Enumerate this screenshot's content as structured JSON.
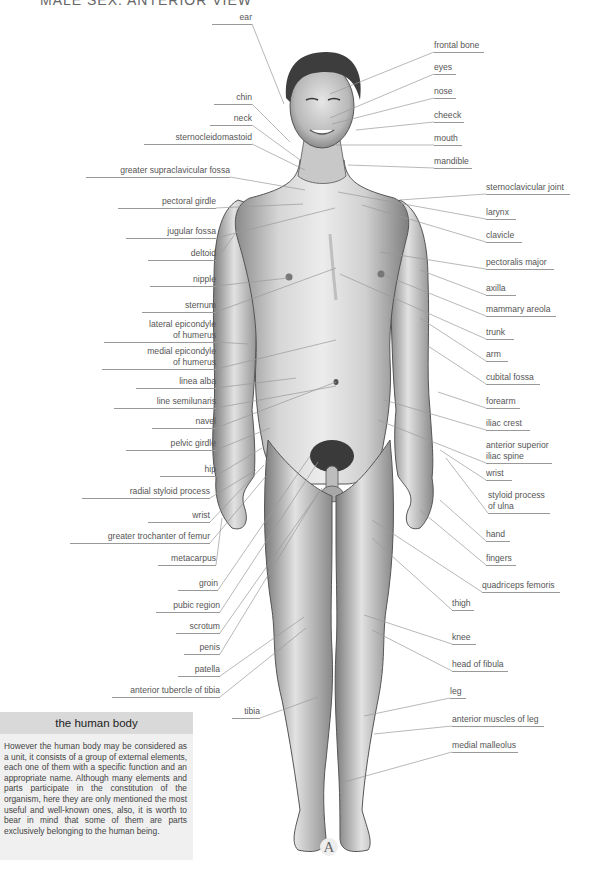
{
  "header": {
    "title": "MALE SEX: ANTERIOR VIEW"
  },
  "figure": {
    "plate_letter": "A"
  },
  "labels_left": [
    {
      "id": "ear",
      "text": "ear",
      "x": 212,
      "y": 12,
      "w": 40,
      "tx": 284,
      "ty": 104
    },
    {
      "id": "chin",
      "text": "chin",
      "x": 214,
      "y": 92,
      "w": 38,
      "tx": 290,
      "ty": 142
    },
    {
      "id": "neck",
      "text": "neck",
      "x": 210,
      "y": 113,
      "w": 42,
      "tx": 300,
      "ty": 160
    },
    {
      "id": "sternocleidomastoid",
      "text": "sternocleidomastoid",
      "x": 144,
      "y": 132,
      "w": 108,
      "tx": 305,
      "ty": 170
    },
    {
      "id": "greater-supraclavicular-fossa",
      "text": "greater supraclavicular fossa",
      "x": 86,
      "y": 165,
      "w": 144,
      "tx": 305,
      "ty": 190
    },
    {
      "id": "pectoral-girdle",
      "text": "pectoral girdle",
      "x": 118,
      "y": 196,
      "w": 98,
      "tx": 303,
      "ty": 204
    },
    {
      "id": "jugular-fossa",
      "text": "jugular fossa",
      "x": 126,
      "y": 226,
      "w": 90,
      "tx": 335,
      "ty": 208
    },
    {
      "id": "deltoid",
      "text": "deltoid",
      "x": 148,
      "y": 248,
      "w": 68,
      "tx": 238,
      "ty": 230
    },
    {
      "id": "nipple",
      "text": "nipple",
      "x": 150,
      "y": 274,
      "w": 66,
      "tx": 288,
      "ty": 278
    },
    {
      "id": "sternum",
      "text": "sternum",
      "x": 142,
      "y": 300,
      "w": 74,
      "tx": 336,
      "ty": 268
    },
    {
      "id": "lateral-epicondyle-of-humerus",
      "text": "lateral epicondyle\nof humerus",
      "x": 104,
      "y": 319,
      "w": 112,
      "tx": 248,
      "ty": 344
    },
    {
      "id": "medial-epicondyle-of-humerus",
      "text": "medial epicondyle\nof humerus",
      "x": 102,
      "y": 346,
      "w": 114,
      "tx": 336,
      "ty": 340
    },
    {
      "id": "linea-alba",
      "text": "linea alba",
      "x": 136,
      "y": 376,
      "w": 80,
      "tx": 296,
      "ty": 378
    },
    {
      "id": "line-semilunaris",
      "text": "line semilunaris",
      "x": 114,
      "y": 396,
      "w": 102,
      "tx": 336,
      "ty": 386
    },
    {
      "id": "navel",
      "text": "navel",
      "x": 152,
      "y": 416,
      "w": 64,
      "tx": 336,
      "ty": 382
    },
    {
      "id": "pelvic-girdle",
      "text": "pelvic girdle",
      "x": 126,
      "y": 438,
      "w": 90,
      "tx": 270,
      "ty": 428
    },
    {
      "id": "hip",
      "text": "hip",
      "x": 160,
      "y": 464,
      "w": 56,
      "tx": 262,
      "ty": 448
    },
    {
      "id": "radial-styloid-process",
      "text": "radial styloid process",
      "x": 82,
      "y": 486,
      "w": 128,
      "tx": 256,
      "ty": 470
    },
    {
      "id": "wrist-left",
      "text": "wrist",
      "x": 148,
      "y": 510,
      "w": 62,
      "tx": 264,
      "ty": 465
    },
    {
      "id": "greater-trochanter-of-femur",
      "text": "greater trochanter of femur",
      "x": 70,
      "y": 531,
      "w": 140,
      "tx": 266,
      "ty": 476
    },
    {
      "id": "metacarpus",
      "text": "metacarpus",
      "x": 158,
      "y": 553,
      "w": 58,
      "tx": 222,
      "ty": 518
    },
    {
      "id": "groin",
      "text": "groin",
      "x": 178,
      "y": 578,
      "w": 40,
      "tx": 310,
      "ty": 456
    },
    {
      "id": "pubic-region",
      "text": "pubic region",
      "x": 156,
      "y": 600,
      "w": 64,
      "tx": 318,
      "ty": 462
    },
    {
      "id": "scrotum",
      "text": "scrotum",
      "x": 176,
      "y": 621,
      "w": 44,
      "tx": 322,
      "ty": 488
    },
    {
      "id": "penis",
      "text": "penis",
      "x": 184,
      "y": 642,
      "w": 36,
      "tx": 320,
      "ty": 490
    },
    {
      "id": "patella",
      "text": "patella",
      "x": 178,
      "y": 664,
      "w": 42,
      "tx": 304,
      "ty": 617
    },
    {
      "id": "anterior-tubercle-of-tibia",
      "text": "anterior tubercle of tibia",
      "x": 112,
      "y": 685,
      "w": 108,
      "tx": 306,
      "ty": 628
    },
    {
      "id": "tibia",
      "text": "tibia",
      "x": 232,
      "y": 706,
      "w": 28,
      "tx": 318,
      "ty": 697
    }
  ],
  "labels_right": [
    {
      "id": "frontal-bone",
      "text": "frontal bone",
      "x": 434,
      "y": 40,
      "w": 50,
      "tx": 330,
      "ty": 94
    },
    {
      "id": "eyes",
      "text": "eyes",
      "x": 434,
      "y": 62,
      "w": 22,
      "tx": 330,
      "ty": 118
    },
    {
      "id": "nose",
      "text": "nose",
      "x": 434,
      "y": 86,
      "w": 22,
      "tx": 332,
      "ty": 124
    },
    {
      "id": "cheeck",
      "text": "cheeck",
      "x": 434,
      "y": 110,
      "w": 30,
      "tx": 356,
      "ty": 130
    },
    {
      "id": "mouth",
      "text": "mouth",
      "x": 434,
      "y": 133,
      "w": 28,
      "tx": 336,
      "ty": 145
    },
    {
      "id": "mandible",
      "text": "mandible",
      "x": 434,
      "y": 156,
      "w": 38,
      "tx": 348,
      "ty": 165
    },
    {
      "id": "sternoclavicular-joint",
      "text": "sternoclavicular joint",
      "x": 486,
      "y": 182,
      "w": 84,
      "tx": 400,
      "ty": 200
    },
    {
      "id": "larynx",
      "text": "larynx",
      "x": 486,
      "y": 207,
      "w": 30,
      "tx": 338,
      "ty": 192
    },
    {
      "id": "clavicle",
      "text": "clavicle",
      "x": 486,
      "y": 230,
      "w": 36,
      "tx": 362,
      "ty": 205
    },
    {
      "id": "pectoralis-major",
      "text": "pectoralis major",
      "x": 486,
      "y": 257,
      "w": 68,
      "tx": 380,
      "ty": 252
    },
    {
      "id": "axilla",
      "text": "axilla",
      "x": 486,
      "y": 283,
      "w": 30,
      "tx": 420,
      "ty": 270
    },
    {
      "id": "mammary-areola",
      "text": "mammary areola",
      "x": 486,
      "y": 304,
      "w": 70,
      "tx": 384,
      "ty": 275
    },
    {
      "id": "trunk",
      "text": "trunk",
      "x": 486,
      "y": 327,
      "w": 28,
      "tx": 340,
      "ty": 274
    },
    {
      "id": "arm",
      "text": "arm",
      "x": 486,
      "y": 349,
      "w": 22,
      "tx": 420,
      "ty": 318
    },
    {
      "id": "cubital-fossa",
      "text": "cubital fossa",
      "x": 486,
      "y": 372,
      "w": 54,
      "tx": 428,
      "ty": 346
    },
    {
      "id": "forearm",
      "text": "forearm",
      "x": 486,
      "y": 396,
      "w": 34,
      "tx": 438,
      "ty": 392
    },
    {
      "id": "iliac-crest",
      "text": "iliac crest",
      "x": 486,
      "y": 418,
      "w": 44,
      "tx": 384,
      "ty": 400
    },
    {
      "id": "anterior-superior-iliac-spine",
      "text": "anterior superior\niliac spine",
      "x": 486,
      "y": 440,
      "w": 66,
      "tx": 378,
      "ty": 420
    },
    {
      "id": "wrist-right",
      "text": "wrist",
      "x": 486,
      "y": 468,
      "w": 26,
      "tx": 440,
      "ty": 450
    },
    {
      "id": "styloid-process-of-ulna",
      "text": "styloid process\nof ulna",
      "x": 488,
      "y": 490,
      "w": 62,
      "tx": 446,
      "ty": 458
    },
    {
      "id": "hand",
      "text": "hand",
      "x": 486,
      "y": 529,
      "w": 24,
      "tx": 440,
      "ty": 500
    },
    {
      "id": "fingers",
      "text": "fingers",
      "x": 486,
      "y": 553,
      "w": 30,
      "tx": 420,
      "ty": 510
    },
    {
      "id": "quadriceps-femoris",
      "text": "quadriceps femoris",
      "x": 482,
      "y": 580,
      "w": 78,
      "tx": 372,
      "ty": 520
    },
    {
      "id": "thigh",
      "text": "thigh",
      "x": 452,
      "y": 598,
      "w": 22,
      "tx": 372,
      "ty": 538
    },
    {
      "id": "knee",
      "text": "knee",
      "x": 452,
      "y": 632,
      "w": 24,
      "tx": 364,
      "ty": 615
    },
    {
      "id": "head-of-fibula",
      "text": "head of fibula",
      "x": 452,
      "y": 659,
      "w": 56,
      "tx": 372,
      "ty": 630
    },
    {
      "id": "leg",
      "text": "leg",
      "x": 450,
      "y": 686,
      "w": 16,
      "tx": 364,
      "ty": 716
    },
    {
      "id": "anterior-muscles-of-leg",
      "text": "anterior muscles of leg",
      "x": 452,
      "y": 714,
      "w": 92,
      "tx": 374,
      "ty": 734
    },
    {
      "id": "medial-malleolus",
      "text": "medial malleolus",
      "x": 452,
      "y": 740,
      "w": 66,
      "tx": 344,
      "ty": 782
    }
  ],
  "info_box": {
    "title": "the human body",
    "body": "However the human body may be considered as a unit, it consists of a group of external elements, each one of them with a specific function and an appropriate name. Although many elements and parts participate in the constitution of the organism, here they are only mentioned the most useful and well-known ones, also, it is worth to bear in mind that some of them are parts exclusively belonging to the human being."
  },
  "colors": {
    "label_text": "#555555",
    "leader_line": "#9a9a9a",
    "info_title_bg": "#d9d9d9",
    "info_body_bg": "#f0f0f0",
    "skin": "#dcdcdc"
  }
}
